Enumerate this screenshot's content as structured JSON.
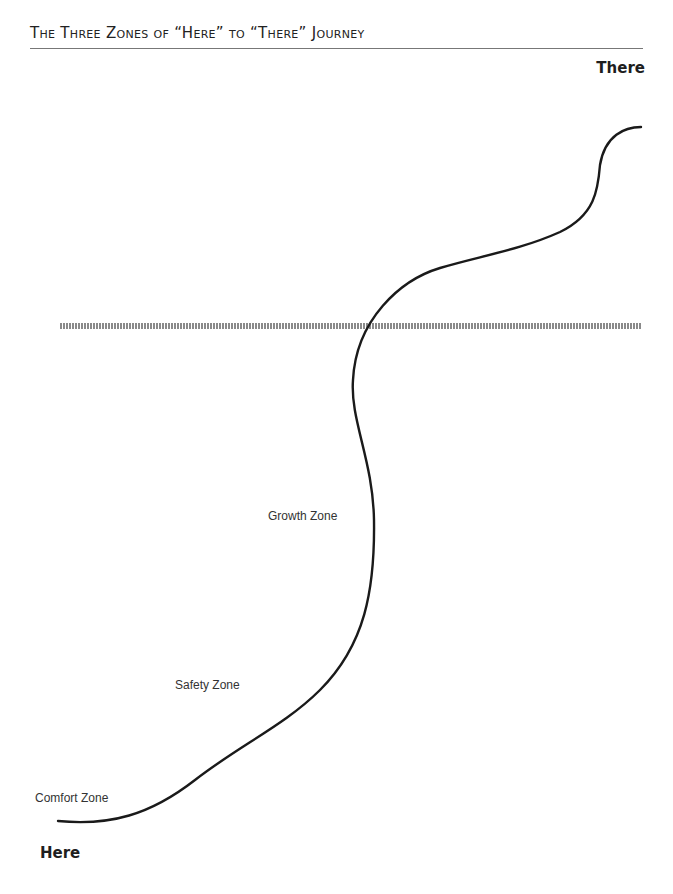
{
  "title": "The Three Zones of “Here” to “There” Journey",
  "endpoints": {
    "start": "Here",
    "end": "There"
  },
  "zones": [
    {
      "label": "Comfort Zone"
    },
    {
      "label": "Safety Zone"
    },
    {
      "label": "Growth Zone"
    }
  ],
  "colors": {
    "path": "#1a1a1a",
    "threshold_line": "#8a8a8a",
    "title_rule": "#777777"
  }
}
